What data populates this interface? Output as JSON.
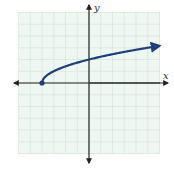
{
  "chart_data": {
    "type": "line",
    "title": "",
    "xlabel": "x",
    "ylabel": "y",
    "function": "y = sqrt(x + 4)",
    "xlim": [
      -6,
      6
    ],
    "ylim": [
      -6,
      6
    ],
    "grid": true,
    "grid_step": 1,
    "start_point": {
      "x": -4,
      "y": 0,
      "closed": true
    },
    "series": [
      {
        "name": "curve",
        "x": [
          -4,
          -3.75,
          -3.5,
          -3,
          -2,
          -1,
          0,
          1,
          2,
          3,
          4,
          5,
          6
        ],
        "y": [
          0,
          0.5,
          0.71,
          1,
          1.41,
          1.73,
          2,
          2.24,
          2.45,
          2.65,
          2.83,
          3,
          3.16
        ],
        "end_arrow": true
      }
    ],
    "colors": {
      "curve": "#1f3f7a",
      "grid_bg": "#eef7f1",
      "grid_line": "#c9ddd0",
      "axis": "#222222"
    }
  },
  "labels": {
    "x_axis": "x",
    "y_axis": "y"
  }
}
